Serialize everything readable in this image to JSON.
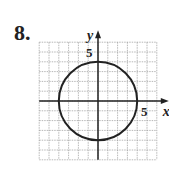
{
  "problem_number": "8.",
  "axes": {
    "x_label": "x",
    "y_label": "y",
    "x_tick_label": "5",
    "y_tick_label": "5"
  },
  "grid": {
    "xmin": -6,
    "xmax": 6,
    "ymin": -6,
    "ymax": 6
  },
  "circle": {
    "center": [
      0,
      0
    ],
    "radius": 4
  },
  "colors": {
    "line": "#222222",
    "grid": "#999999"
  }
}
